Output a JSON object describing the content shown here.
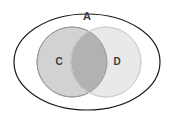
{
  "diagram": {
    "type": "venn",
    "title_label": "A",
    "canvas": {
      "width": 175,
      "height": 119,
      "background": "#ffffff"
    },
    "universe": {
      "name": "universe-ellipse",
      "label": "A",
      "label_x": 87,
      "label_y": 17,
      "cx": 87,
      "cy": 62,
      "rx": 73,
      "ry": 48,
      "fill": "#ffffff",
      "stroke": "#1a1a1a",
      "stroke_width": 1.2
    },
    "sets": [
      {
        "name": "set-c",
        "label": "C",
        "cx": 72,
        "cy": 62,
        "r": 35,
        "fill": "#d2d2d2",
        "stroke": "#9a9a9a",
        "stroke_width": 1,
        "label_x": 59,
        "label_y": 62
      },
      {
        "name": "set-d",
        "label": "D",
        "cx": 106,
        "cy": 62,
        "r": 35,
        "fill": "#e9e9e9",
        "stroke": "#cfcfcf",
        "stroke_width": 1,
        "label_x": 117,
        "label_y": 62
      }
    ],
    "intersection": {
      "name": "intersection-cd",
      "fill": "#b2b2b2",
      "stroke": "#8f8f8f",
      "stroke_width": 1
    }
  }
}
